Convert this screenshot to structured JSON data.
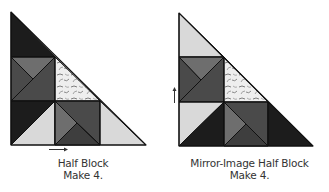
{
  "figures": [
    {
      "id": "half-block",
      "caption_line1": "Half Block",
      "caption_line2": "Make 4.",
      "pressing_arrow": "right"
    },
    {
      "id": "mirror-image-half-block",
      "caption_line1": "Mirror-Image Half Block",
      "caption_line2": "Make 4.",
      "pressing_arrow": "up"
    }
  ],
  "colors": {
    "black": "#1c1c1c",
    "dark_gray": "#4a4a4a",
    "medium_gray": "#6e6e6e",
    "light_gray": "#d9d9d9",
    "print_fabric_bg": "#eeeeee",
    "print_fabric_motif": "#7a7a7a",
    "outline": "#111111"
  }
}
